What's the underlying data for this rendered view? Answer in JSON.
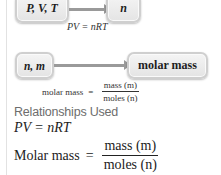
{
  "flow1": {
    "from_box": "P, V, T",
    "to_box": "n",
    "caption": "PV = nRT"
  },
  "flow2": {
    "from_box": "n, m",
    "to_box": "molar mass",
    "caption": {
      "lhs": "molar mass",
      "equals": "=",
      "numerator": "mass (m)",
      "denominator": "moles (n)"
    }
  },
  "relationships": {
    "heading": "Relationships Used",
    "equation1": "PV = nRT",
    "equation2": {
      "lhs": "Molar mass",
      "equals": "=",
      "numerator": "mass (m)",
      "denominator": "moles (n)"
    }
  },
  "colors": {
    "box_fill": "#e8e8e8",
    "box_border": "#cfcfcf",
    "arrow": "#9a9a9a",
    "heading": "#6d6d6d",
    "text": "#222222"
  }
}
